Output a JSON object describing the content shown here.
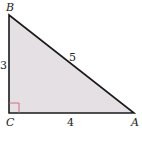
{
  "diagram": {
    "type": "right-triangle",
    "vertices": {
      "A": {
        "label": "A",
        "x": 134,
        "y": 113
      },
      "B": {
        "label": "B",
        "x": 9,
        "y": 15
      },
      "C": {
        "label": "C",
        "x": 9,
        "y": 113
      }
    },
    "sides": {
      "BC": {
        "label": "3"
      },
      "AB": {
        "label": "5"
      },
      "CA": {
        "label": "4"
      }
    },
    "right_angle_at": "C",
    "colors": {
      "fill": "#e5e0e3",
      "stroke": "#1a1a1a",
      "right_angle_marker": "#d4607a"
    }
  }
}
